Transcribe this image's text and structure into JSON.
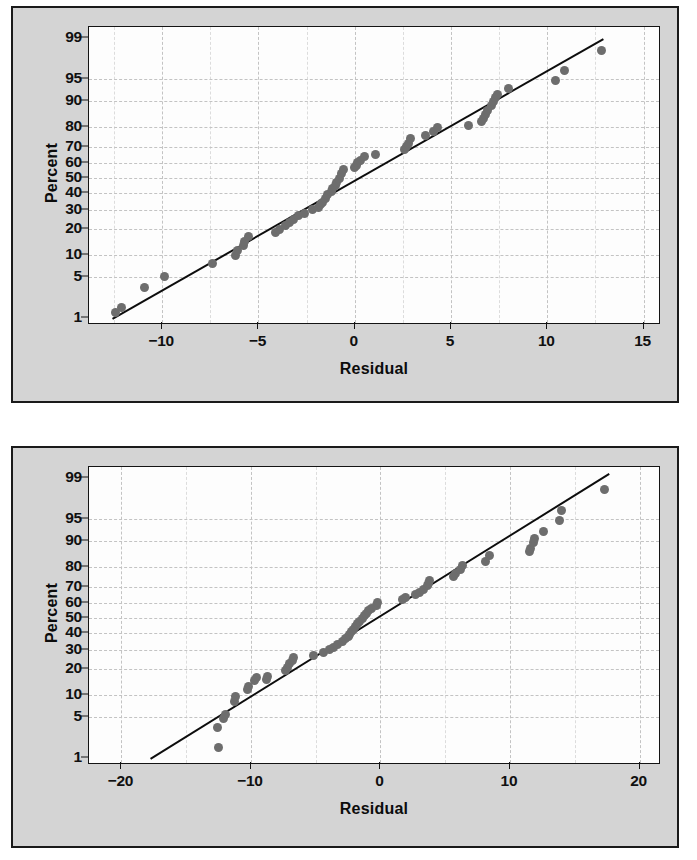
{
  "page": {
    "background": "#ffffff",
    "panel_background": "#d4d4d4",
    "plot_background": "#fdfdfd",
    "frame_color": "#1a1a1a",
    "grid_color": "#c3c3c3",
    "marker_color": "#6d6d6d",
    "line_color": "#0d0d0d"
  },
  "chart_data": [
    {
      "id": "top",
      "type": "scatter",
      "title": "",
      "subtitle": "",
      "xlabel": "Residual",
      "ylabel": "Percent",
      "xlim": [
        -13.8,
        15.8
      ],
      "ylim_percent": [
        0.8,
        99.4
      ],
      "grid": true,
      "legend": "none",
      "xticks": [
        -10,
        -5,
        0,
        5,
        10,
        15
      ],
      "xtick_labels": [
        "−10",
        "−5",
        "0",
        "5",
        "10",
        "15"
      ],
      "x_minor_ticks": [
        -12.5,
        -7.5,
        -2.5,
        2.5,
        7.5,
        12.5
      ],
      "yticks": [
        1,
        5,
        10,
        20,
        30,
        40,
        50,
        60,
        70,
        80,
        90,
        95,
        99
      ],
      "ytick_labels": [
        "1",
        "5",
        "10",
        "20",
        "30",
        "40",
        "50",
        "60",
        "70",
        "80",
        "90",
        "95",
        "99"
      ],
      "y_scale": "normal-probability",
      "reference_line": {
        "x0": -12.6,
        "p0": 1.0,
        "x1": 12.9,
        "p1": 99.0
      },
      "annotations": [],
      "points": [
        {
          "x": -12.4,
          "p": 1.3
        },
        {
          "x": -12.1,
          "p": 1.6
        },
        {
          "x": -10.9,
          "p": 3.5
        },
        {
          "x": -9.9,
          "p": 5.1
        },
        {
          "x": -7.4,
          "p": 7.7
        },
        {
          "x": -6.2,
          "p": 10.0
        },
        {
          "x": -6.1,
          "p": 11.5
        },
        {
          "x": -5.8,
          "p": 13.0
        },
        {
          "x": -5.7,
          "p": 14.5
        },
        {
          "x": -5.5,
          "p": 16.5
        },
        {
          "x": -4.1,
          "p": 18.5
        },
        {
          "x": -3.9,
          "p": 19.5
        },
        {
          "x": -3.6,
          "p": 21.5
        },
        {
          "x": -3.4,
          "p": 23.0
        },
        {
          "x": -3.2,
          "p": 24.5
        },
        {
          "x": -2.9,
          "p": 26.5
        },
        {
          "x": -2.6,
          "p": 28.0
        },
        {
          "x": -2.2,
          "p": 30.0
        },
        {
          "x": -1.9,
          "p": 31.5
        },
        {
          "x": -1.8,
          "p": 33.0
        },
        {
          "x": -1.7,
          "p": 34.5
        },
        {
          "x": -1.5,
          "p": 37.0
        },
        {
          "x": -1.4,
          "p": 39.0
        },
        {
          "x": -1.2,
          "p": 41.0
        },
        {
          "x": -1.15,
          "p": 43.0
        },
        {
          "x": -1.0,
          "p": 45.0
        },
        {
          "x": -0.95,
          "p": 47.0
        },
        {
          "x": -0.8,
          "p": 50.0
        },
        {
          "x": -0.7,
          "p": 53.0
        },
        {
          "x": -0.6,
          "p": 55.5
        },
        {
          "x": 0.0,
          "p": 57.0
        },
        {
          "x": 0.1,
          "p": 58.5
        },
        {
          "x": 0.15,
          "p": 60.0
        },
        {
          "x": 0.3,
          "p": 61.5
        },
        {
          "x": 0.5,
          "p": 64.0
        },
        {
          "x": 1.1,
          "p": 65.5
        },
        {
          "x": 2.6,
          "p": 68.0
        },
        {
          "x": 2.7,
          "p": 70.0
        },
        {
          "x": 2.8,
          "p": 72.0
        },
        {
          "x": 2.9,
          "p": 74.5
        },
        {
          "x": 3.7,
          "p": 76.0
        },
        {
          "x": 4.1,
          "p": 78.0
        },
        {
          "x": 4.3,
          "p": 80.0
        },
        {
          "x": 5.9,
          "p": 81.0
        },
        {
          "x": 6.6,
          "p": 82.5
        },
        {
          "x": 6.7,
          "p": 84.0
        },
        {
          "x": 6.8,
          "p": 85.5
        },
        {
          "x": 6.9,
          "p": 87.0
        },
        {
          "x": 7.1,
          "p": 88.5
        },
        {
          "x": 7.2,
          "p": 90.0
        },
        {
          "x": 7.3,
          "p": 91.0
        },
        {
          "x": 7.4,
          "p": 91.8
        },
        {
          "x": 8.0,
          "p": 93.2
        },
        {
          "x": 10.4,
          "p": 94.8
        },
        {
          "x": 10.9,
          "p": 96.3
        },
        {
          "x": 12.8,
          "p": 98.3
        }
      ]
    },
    {
      "id": "bottom",
      "type": "scatter",
      "title": "",
      "subtitle": "",
      "xlabel": "Residual",
      "ylabel": "Percent",
      "xlim": [
        -22.5,
        21.5
      ],
      "ylim_percent": [
        0.8,
        99.4
      ],
      "grid": true,
      "legend": "none",
      "xticks": [
        -20,
        -10,
        0,
        10,
        20
      ],
      "xtick_labels": [
        "−20",
        "−10",
        "0",
        "10",
        "20"
      ],
      "x_minor_ticks": [
        -15,
        -5,
        5,
        15
      ],
      "yticks": [
        1,
        5,
        10,
        20,
        30,
        40,
        50,
        60,
        70,
        80,
        90,
        95,
        99
      ],
      "ytick_labels": [
        "1",
        "5",
        "10",
        "20",
        "30",
        "40",
        "50",
        "60",
        "70",
        "80",
        "90",
        "95",
        "99"
      ],
      "y_scale": "normal-probability",
      "reference_line": {
        "x0": -17.8,
        "p0": 1.0,
        "x1": 17.6,
        "p1": 99.2
      },
      "annotations": [],
      "points": [
        {
          "x": -12.5,
          "p": 1.6
        },
        {
          "x": -12.6,
          "p": 3.4
        },
        {
          "x": -12.1,
          "p": 4.8
        },
        {
          "x": -12.0,
          "p": 5.5
        },
        {
          "x": -11.3,
          "p": 8.3
        },
        {
          "x": -11.2,
          "p": 9.6
        },
        {
          "x": -10.3,
          "p": 11.8
        },
        {
          "x": -10.2,
          "p": 12.9
        },
        {
          "x": -9.7,
          "p": 14.8
        },
        {
          "x": -9.6,
          "p": 16.0
        },
        {
          "x": -8.8,
          "p": 15.5
        },
        {
          "x": -8.7,
          "p": 16.5
        },
        {
          "x": -7.3,
          "p": 19.0
        },
        {
          "x": -7.2,
          "p": 20.5
        },
        {
          "x": -7.0,
          "p": 22.5
        },
        {
          "x": -6.8,
          "p": 24.0
        },
        {
          "x": -6.7,
          "p": 25.5
        },
        {
          "x": -5.2,
          "p": 26.5
        },
        {
          "x": -4.4,
          "p": 28.5
        },
        {
          "x": -3.9,
          "p": 30.0
        },
        {
          "x": -3.6,
          "p": 31.5
        },
        {
          "x": -3.3,
          "p": 33.0
        },
        {
          "x": -2.9,
          "p": 35.0
        },
        {
          "x": -2.7,
          "p": 36.5
        },
        {
          "x": -2.5,
          "p": 38.0
        },
        {
          "x": -2.4,
          "p": 39.5
        },
        {
          "x": -2.2,
          "p": 41.0
        },
        {
          "x": -2.1,
          "p": 42.5
        },
        {
          "x": -1.9,
          "p": 44.5
        },
        {
          "x": -1.8,
          "p": 46.5
        },
        {
          "x": -1.6,
          "p": 48.0
        },
        {
          "x": -1.4,
          "p": 50.0
        },
        {
          "x": -1.2,
          "p": 51.5
        },
        {
          "x": -1.1,
          "p": 53.0
        },
        {
          "x": -0.9,
          "p": 55.0
        },
        {
          "x": -0.7,
          "p": 56.5
        },
        {
          "x": -0.3,
          "p": 58.5
        },
        {
          "x": -0.2,
          "p": 60.5
        },
        {
          "x": 1.7,
          "p": 62.0
        },
        {
          "x": 1.9,
          "p": 63.5
        },
        {
          "x": 2.7,
          "p": 65.0
        },
        {
          "x": 3.0,
          "p": 66.5
        },
        {
          "x": 3.3,
          "p": 68.5
        },
        {
          "x": 3.6,
          "p": 70.5
        },
        {
          "x": 3.7,
          "p": 72.0
        },
        {
          "x": 3.8,
          "p": 73.5
        },
        {
          "x": 5.6,
          "p": 75.5
        },
        {
          "x": 5.8,
          "p": 77.0
        },
        {
          "x": 6.2,
          "p": 79.0
        },
        {
          "x": 6.3,
          "p": 81.0
        },
        {
          "x": 8.1,
          "p": 82.5
        },
        {
          "x": 8.4,
          "p": 85.0
        },
        {
          "x": 11.5,
          "p": 86.5
        },
        {
          "x": 11.6,
          "p": 87.5
        },
        {
          "x": 11.8,
          "p": 89.5
        },
        {
          "x": 11.9,
          "p": 90.8
        },
        {
          "x": 12.6,
          "p": 92.5
        },
        {
          "x": 13.8,
          "p": 94.8
        },
        {
          "x": 14.0,
          "p": 96.3
        },
        {
          "x": 17.3,
          "p": 98.4
        }
      ]
    }
  ]
}
